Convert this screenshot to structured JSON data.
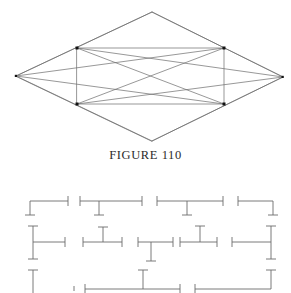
{
  "page": {
    "width": 291,
    "height": 293,
    "background_color": "#ffffff",
    "ink_color": "#5a5a5a",
    "caption_color": "#2b2b2b"
  },
  "caption": {
    "text": "FIGURE 110"
  },
  "figure_top": {
    "name": "rhombus-with-inscribed-rectangle",
    "stroke_color": "#6b6b6b",
    "stroke_width": 0.7,
    "vertex_marker_color": "#111111",
    "outer_rhombus": {
      "left_vertex": [
        16,
        76
      ],
      "top_vertex": [
        152,
        12
      ],
      "right_vertex": [
        283,
        77
      ],
      "bottom_vertex": [
        152,
        141
      ]
    },
    "inner_rectangle": {
      "top_left": [
        77,
        48
      ],
      "top_right": [
        224,
        48
      ],
      "bottom_right": [
        224,
        104
      ],
      "bottom_left": [
        77,
        104
      ]
    },
    "diagonals": [
      {
        "from": [
          77,
          48
        ],
        "to": [
          224,
          104
        ]
      },
      {
        "from": [
          77,
          104
        ],
        "to": [
          224,
          48
        ]
      }
    ],
    "marked_vertices": [
      [
        77,
        48
      ],
      [
        224,
        48
      ],
      [
        224,
        104
      ],
      [
        77,
        104
      ],
      [
        16,
        76
      ],
      [
        283,
        77
      ]
    ]
  },
  "figure_bottom": {
    "name": "dimension-bracket-grid",
    "stroke_color": "#6b6b6b",
    "stroke_width": 0.9,
    "cap_length": 9,
    "note": "grid of horizontal dimension lines with perpendicular tick caps; clipped at bottom page edge",
    "rows": [
      {
        "y": 16,
        "segments": [
          {
            "x1": 30,
            "x2": 68,
            "left_cap": "down",
            "right_cap": "full"
          },
          {
            "x1": 80,
            "x2": 142,
            "left_cap": "full",
            "right_cap": "full",
            "mid_tick": {
              "x": 99,
              "dir": "down"
            }
          },
          {
            "x1": 157,
            "x2": 223,
            "left_cap": "full",
            "right_cap": "full",
            "mid_tick": {
              "x": 187,
              "dir": "down"
            }
          },
          {
            "x1": 238,
            "x2": 273,
            "left_cap": "full",
            "right_cap": "down"
          }
        ]
      },
      {
        "y": 57,
        "segments": [
          {
            "x1": 33,
            "x2": 65,
            "left_cap": "tall-both",
            "right_cap": "full"
          },
          {
            "x1": 83,
            "x2": 122,
            "left_cap": "full",
            "right_cap": "full",
            "mid_tick": {
              "x": 103,
              "dir": "up"
            }
          },
          {
            "x1": 138,
            "x2": 173,
            "left_cap": "full",
            "right_cap": "full",
            "mid_tick": {
              "x": 151,
              "dir": "down"
            }
          },
          {
            "x1": 180,
            "x2": 217,
            "left_cap": "full",
            "right_cap": "full",
            "mid_tick": {
              "x": 200,
              "dir": "up"
            }
          },
          {
            "x1": 232,
            "x2": 271,
            "left_cap": "full",
            "right_cap": "tall-both"
          }
        ]
      },
      {
        "y": 97,
        "segments": [
          {
            "x1": 33,
            "x2": 33,
            "left_cap": "tall-both",
            "right_cap": "none"
          },
          {
            "x1": 85,
            "x2": 180,
            "left_cap": "full",
            "right_cap": "full",
            "mid_tick": {
              "x": 143,
              "dir": "up"
            }
          },
          {
            "x1": 195,
            "x2": 271,
            "left_cap": "full",
            "right_cap": "tall-both"
          }
        ]
      }
    ],
    "stray_ticks": [
      {
        "x": 33,
        "y": 76
      },
      {
        "x": 143,
        "y": 76
      },
      {
        "x": 271,
        "y": 76
      }
    ]
  }
}
